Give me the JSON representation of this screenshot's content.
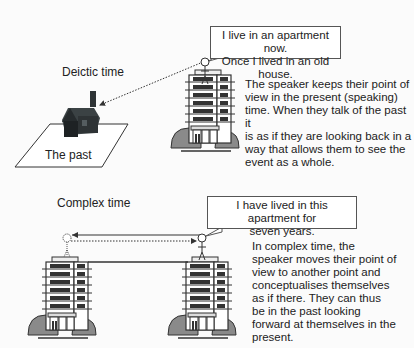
{
  "deictic": {
    "heading": "Deictic time",
    "past_label": "The past",
    "speech": [
      "I live in an apartment now.",
      "Once I lived in an old house."
    ],
    "description": [
      "The speaker keeps their point of",
      "view in the present (speaking)",
      "time. When they talk of the past it",
      "is as if they are looking back in a",
      "way that allows them to see the",
      "event as a whole."
    ]
  },
  "complex": {
    "heading": "Complex time",
    "speech": [
      "I have lived in this apartment for",
      "seven years."
    ],
    "description": [
      "In complex time, the",
      "speaker moves their point of",
      "view to another point and",
      "conceptualises themselves",
      "as if there. They can thus",
      "be in the past looking",
      "forward at themselves in the",
      "present."
    ]
  },
  "colors": {
    "line": "#333333",
    "bush": "#8a8a8a",
    "house": "#2e3335"
  }
}
